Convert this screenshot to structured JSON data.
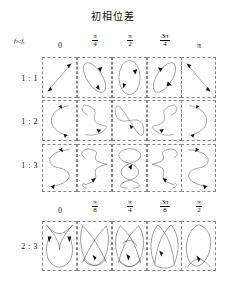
{
  "title": "初相位差",
  "axis_label": "fₕ:fᵧ",
  "header_rows": [
    {
      "id": "phase-header-top",
      "labels": [
        {
          "kind": "plain",
          "text": "0"
        },
        {
          "kind": "fraction",
          "num": "π",
          "den": "4",
          "text": "π/4"
        },
        {
          "kind": "fraction",
          "num": "π",
          "den": "2",
          "text": "π/2"
        },
        {
          "kind": "fraction",
          "num": "3π",
          "den": "4",
          "text": "3π/4"
        },
        {
          "kind": "plain",
          "text": "π"
        }
      ]
    },
    {
      "id": "phase-header-bottom",
      "labels": [
        {
          "kind": "plain",
          "text": "0"
        },
        {
          "kind": "fraction",
          "num": "π",
          "den": "8",
          "text": "π/8"
        },
        {
          "kind": "fraction",
          "num": "π",
          "den": "4",
          "text": "π/4"
        },
        {
          "kind": "fraction",
          "num": "3π",
          "den": "8",
          "text": "3π/8"
        },
        {
          "kind": "fraction",
          "num": "π",
          "den": "2",
          "text": "π/2"
        }
      ]
    }
  ],
  "rows": [
    {
      "ratio": "1 : 1",
      "phases": [
        "0",
        "π/4",
        "π/2",
        "3π/4",
        "π"
      ]
    },
    {
      "ratio": "1 : 2",
      "phases": [
        "0",
        "π/4",
        "π/2",
        "3π/4",
        "π"
      ]
    },
    {
      "ratio": "1 : 3",
      "phases": [
        "0",
        "π/4",
        "π/2",
        "3π/4",
        "π"
      ]
    },
    {
      "ratio": "2 : 3",
      "phases": [
        "0",
        "π/8",
        "π/4",
        "3π/8",
        "π/2"
      ]
    }
  ],
  "colors": {
    "curve": "#2b2b2b",
    "cell_border": "#8a8a8a",
    "text": "#111111",
    "background": "#ffffff"
  },
  "figure_type": "lissajous-table"
}
